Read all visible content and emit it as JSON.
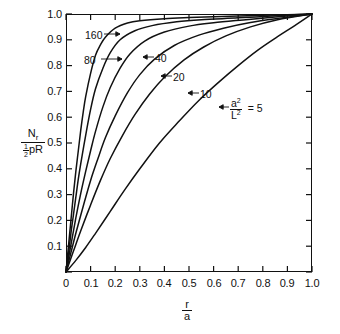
{
  "chart_data": {
    "type": "line",
    "title": "",
    "xlabel": "r/a",
    "ylabel": "N_r / (1/2 pR)",
    "xlim": [
      0,
      1.0
    ],
    "ylim": [
      0,
      1.0
    ],
    "grid": false,
    "legend_position": "inline-annotations",
    "x_ticks": [
      "0",
      "0.1",
      "0.2",
      "0.3",
      "0.4",
      "0.5",
      "0.6",
      "0.7",
      "0.8",
      "0.9",
      "1.0"
    ],
    "y_ticks": [
      "0",
      "0.1",
      "0.2",
      "0.3",
      "0.4",
      "0.5",
      "0.6",
      "0.7",
      "0.8",
      "0.9",
      "1.0"
    ],
    "parameter_symbol": "a^2/L^2",
    "series": [
      {
        "name": "160",
        "label": "160",
        "x": [
          0.0,
          0.01,
          0.02,
          0.03,
          0.04,
          0.05,
          0.06,
          0.07,
          0.08,
          0.1,
          0.12,
          0.14,
          0.16,
          0.2,
          0.25,
          0.3,
          0.4,
          0.5,
          0.6,
          0.7,
          0.8,
          0.9,
          1.0
        ],
        "y": [
          0.0,
          0.1,
          0.2,
          0.3,
          0.39,
          0.47,
          0.55,
          0.62,
          0.68,
          0.77,
          0.84,
          0.88,
          0.91,
          0.945,
          0.965,
          0.974,
          0.982,
          0.986,
          0.989,
          0.992,
          0.995,
          0.997,
          1.0
        ]
      },
      {
        "name": "80",
        "label": "80",
        "x": [
          0.0,
          0.01,
          0.02,
          0.03,
          0.04,
          0.05,
          0.06,
          0.08,
          0.1,
          0.12,
          0.15,
          0.18,
          0.22,
          0.28,
          0.35,
          0.45,
          0.55,
          0.7,
          0.85,
          1.0
        ],
        "y": [
          0.0,
          0.07,
          0.15,
          0.22,
          0.29,
          0.36,
          0.42,
          0.53,
          0.63,
          0.71,
          0.79,
          0.85,
          0.9,
          0.935,
          0.955,
          0.97,
          0.978,
          0.985,
          0.993,
          1.0
        ]
      },
      {
        "name": "40",
        "label": "40",
        "x": [
          0.0,
          0.02,
          0.04,
          0.06,
          0.08,
          0.1,
          0.12,
          0.15,
          0.18,
          0.22,
          0.26,
          0.32,
          0.4,
          0.5,
          0.6,
          0.72,
          0.85,
          1.0
        ],
        "y": [
          0.0,
          0.105,
          0.21,
          0.305,
          0.39,
          0.47,
          0.545,
          0.64,
          0.715,
          0.79,
          0.845,
          0.895,
          0.93,
          0.953,
          0.966,
          0.977,
          0.988,
          1.0
        ]
      },
      {
        "name": "20",
        "label": "20",
        "x": [
          0.0,
          0.02,
          0.04,
          0.07,
          0.1,
          0.13,
          0.16,
          0.2,
          0.25,
          0.3,
          0.36,
          0.44,
          0.54,
          0.64,
          0.75,
          0.87,
          1.0
        ],
        "y": [
          0.0,
          0.075,
          0.15,
          0.255,
          0.355,
          0.44,
          0.52,
          0.605,
          0.695,
          0.765,
          0.825,
          0.878,
          0.918,
          0.945,
          0.967,
          0.984,
          1.0
        ]
      },
      {
        "name": "10",
        "label": "10",
        "x": [
          0.0,
          0.03,
          0.06,
          0.1,
          0.14,
          0.18,
          0.23,
          0.28,
          0.34,
          0.4,
          0.48,
          0.56,
          0.65,
          0.75,
          0.86,
          1.0
        ],
        "y": [
          0.0,
          0.08,
          0.16,
          0.26,
          0.355,
          0.44,
          0.53,
          0.61,
          0.69,
          0.755,
          0.822,
          0.872,
          0.915,
          0.95,
          0.978,
          1.0
        ]
      },
      {
        "name": "5",
        "label": "a^2/L^2 = 5",
        "x": [
          0.0,
          0.04,
          0.08,
          0.12,
          0.18,
          0.24,
          0.3,
          0.38,
          0.46,
          0.54,
          0.62,
          0.7,
          0.78,
          0.86,
          0.93,
          1.0
        ],
        "y": [
          0.0,
          0.045,
          0.095,
          0.15,
          0.235,
          0.32,
          0.4,
          0.5,
          0.585,
          0.665,
          0.735,
          0.8,
          0.86,
          0.912,
          0.955,
          1.0
        ]
      }
    ],
    "annotations": [
      {
        "text": "160",
        "arrow": "right"
      },
      {
        "text": "80",
        "arrow": "right"
      },
      {
        "text": "40",
        "arrow": "left"
      },
      {
        "text": "20",
        "arrow": "left"
      },
      {
        "text": "10",
        "arrow": "left"
      },
      {
        "text": "= 5",
        "arrow": "left",
        "prefix_numerator": "a",
        "prefix_denominator": "L"
      }
    ]
  },
  "axes": {
    "y_title_numerator": "N",
    "y_title_numerator_sub": "r",
    "y_title_den_half": "1",
    "y_title_den_half2": "2",
    "y_title_den_rest": "pR",
    "x_title_numerator": "r",
    "x_title_denominator": "a"
  },
  "tick_labels": {
    "x": [
      "0",
      "0.1",
      "0.2",
      "0.3",
      "0.4",
      "0.5",
      "0.6",
      "0.7",
      "0.8",
      "0.9",
      "1.0"
    ],
    "y": [
      "0",
      "0.1",
      "0.2",
      "0.3",
      "0.4",
      "0.5",
      "0.6",
      "0.7",
      "0.8",
      "0.9",
      "1.0"
    ]
  },
  "curve_labels": {
    "c160": "160",
    "c80": "80",
    "c40": "40",
    "c20": "20",
    "c10": "10",
    "c5_eq": "= 5",
    "c5_num": "a",
    "c5_den": "L",
    "c5_sup": "2"
  }
}
